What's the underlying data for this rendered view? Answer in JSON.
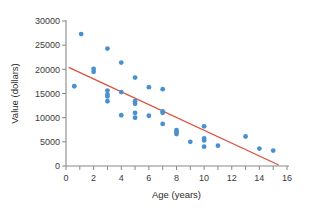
{
  "chart_data": {
    "type": "scatter",
    "title": "",
    "xlabel": "Age (years)",
    "ylabel": "Value (dollars)",
    "xlim": [
      0,
      16
    ],
    "ylim": [
      0,
      30000
    ],
    "xticks": [
      0,
      2,
      4,
      6,
      8,
      10,
      12,
      14,
      16
    ],
    "xtick_labels": [
      "0",
      "2",
      "4",
      "6",
      "8",
      "10",
      "12",
      "14",
      "16"
    ],
    "yticks": [
      0,
      5000,
      10000,
      15000,
      20000,
      25000,
      30000
    ],
    "ytick_labels": [
      "0",
      "5000",
      "10000",
      "15000",
      "20000",
      "25000",
      "30000"
    ],
    "grid": false,
    "legend": null,
    "point_color": "#4a90d0",
    "trendline_color": "#d9503c",
    "axis_color": "#888888",
    "points": [
      {
        "x": 0.6,
        "y": 16500
      },
      {
        "x": 1.1,
        "y": 27300
      },
      {
        "x": 2.0,
        "y": 20100
      },
      {
        "x": 2.0,
        "y": 19500
      },
      {
        "x": 3.0,
        "y": 24300
      },
      {
        "x": 3.0,
        "y": 15600
      },
      {
        "x": 3.0,
        "y": 14800
      },
      {
        "x": 3.0,
        "y": 14400
      },
      {
        "x": 3.0,
        "y": 13400
      },
      {
        "x": 4.0,
        "y": 21400
      },
      {
        "x": 4.0,
        "y": 15300
      },
      {
        "x": 4.0,
        "y": 10500
      },
      {
        "x": 5.0,
        "y": 18300
      },
      {
        "x": 5.0,
        "y": 13400
      },
      {
        "x": 5.0,
        "y": 12900
      },
      {
        "x": 5.0,
        "y": 11000
      },
      {
        "x": 5.0,
        "y": 10000
      },
      {
        "x": 6.0,
        "y": 16300
      },
      {
        "x": 6.0,
        "y": 10400
      },
      {
        "x": 7.0,
        "y": 15900
      },
      {
        "x": 7.0,
        "y": 11300
      },
      {
        "x": 7.0,
        "y": 11000
      },
      {
        "x": 7.0,
        "y": 8700
      },
      {
        "x": 8.0,
        "y": 7400
      },
      {
        "x": 8.0,
        "y": 7000
      },
      {
        "x": 8.0,
        "y": 6600
      },
      {
        "x": 9.0,
        "y": 5000
      },
      {
        "x": 10.0,
        "y": 8200
      },
      {
        "x": 10.0,
        "y": 5700
      },
      {
        "x": 10.0,
        "y": 5300
      },
      {
        "x": 10.0,
        "y": 4000
      },
      {
        "x": 11.0,
        "y": 4200
      },
      {
        "x": 13.0,
        "y": 6100
      },
      {
        "x": 14.0,
        "y": 3600
      },
      {
        "x": 15.0,
        "y": 3200
      }
    ],
    "trendline": {
      "x_start": 0.2,
      "y_start": 20400,
      "x_end": 15.4,
      "y_end": 200
    }
  }
}
